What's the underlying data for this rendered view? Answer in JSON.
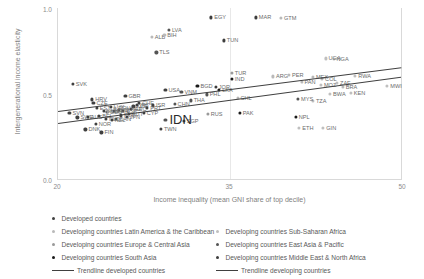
{
  "chart_data": {
    "type": "scatter",
    "title": "",
    "xlabel": "Income inequality (mean GNI share of top decile)",
    "ylabel": "Intergenerational income elasticity",
    "xlim": [
      20,
      50
    ],
    "ylim": [
      0.0,
      1.0
    ],
    "xticks": [
      "20",
      "35",
      "50"
    ],
    "yticks": [
      "1.0",
      "0.5",
      "0.0"
    ],
    "grid": "vertical-only",
    "legend_position": "bottom",
    "series": [
      {
        "name": "Developed countries",
        "color": "#404040",
        "points": [
          {
            "label": "SVK",
            "x": 21.3,
            "y": 0.555
          },
          {
            "label": "HRV",
            "x": 23.0,
            "y": 0.465
          },
          {
            "label": "CZE",
            "x": 23.1,
            "y": 0.445
          },
          {
            "label": "GBR",
            "x": 25.9,
            "y": 0.485
          },
          {
            "label": "USA",
            "x": 29.4,
            "y": 0.52
          },
          {
            "label": "LUX",
            "x": 24.6,
            "y": 0.42
          },
          {
            "label": "KOR",
            "x": 26.6,
            "y": 0.425
          },
          {
            "label": "SVN",
            "x": 21.0,
            "y": 0.385
          },
          {
            "label": "SWE",
            "x": 21.7,
            "y": 0.36
          },
          {
            "label": "AUS",
            "x": 22.6,
            "y": 0.362
          },
          {
            "label": "NLD",
            "x": 24.2,
            "y": 0.352
          },
          {
            "label": "NOR",
            "x": 23.3,
            "y": 0.32
          },
          {
            "label": "DNK",
            "x": 22.4,
            "y": 0.29
          },
          {
            "label": "FIN",
            "x": 23.8,
            "y": 0.272
          },
          {
            "label": "TWN",
            "x": 29.0,
            "y": 0.295
          },
          {
            "label": "CYP",
            "x": 27.5,
            "y": 0.385
          },
          {
            "label": "SGP",
            "x": 31.0,
            "y": 0.34
          },
          {
            "label": "ITA",
            "x": 25.3,
            "y": 0.405
          },
          {
            "label": "ESP",
            "x": 25.7,
            "y": 0.4
          },
          {
            "label": "FRA",
            "x": 24.9,
            "y": 0.397
          },
          {
            "label": "DEU",
            "x": 24.3,
            "y": 0.392
          },
          {
            "label": "BEL",
            "x": 23.6,
            "y": 0.368
          },
          {
            "label": "AUT",
            "x": 26.2,
            "y": 0.38
          },
          {
            "label": "CHE",
            "x": 27.1,
            "y": 0.445
          },
          {
            "label": "IRL",
            "x": 26.9,
            "y": 0.435
          },
          {
            "label": "ISR",
            "x": 28.3,
            "y": 0.43
          },
          {
            "label": "JPN",
            "x": 26.0,
            "y": 0.362
          },
          {
            "label": "CAN",
            "x": 25.1,
            "y": 0.352
          },
          {
            "label": "NZL",
            "x": 24.7,
            "y": 0.345
          },
          {
            "label": "POL",
            "x": 25.5,
            "y": 0.372
          },
          {
            "label": "PRT",
            "x": 27.8,
            "y": 0.418
          },
          {
            "label": "GRC",
            "x": 26.4,
            "y": 0.41
          },
          {
            "label": "HUN",
            "x": 24.0,
            "y": 0.398
          },
          {
            "label": "EST",
            "x": 23.4,
            "y": 0.415
          }
        ]
      },
      {
        "name": "Developing countries Latin America & the Caribbean",
        "color": "#b9b9b9",
        "points": [
          {
            "label": "GTM",
            "x": 39.5,
            "y": 0.94
          },
          {
            "label": "PAN",
            "x": 41.3,
            "y": 0.57
          },
          {
            "label": "CHL",
            "x": 35.7,
            "y": 0.475
          },
          {
            "label": "ALB",
            "x": 28.2,
            "y": 0.83
          },
          {
            "label": "BIH",
            "x": 29.3,
            "y": 0.845
          },
          {
            "label": "BRA",
            "x": 44.9,
            "y": 0.54
          },
          {
            "label": "ARG",
            "x": 38.8,
            "y": 0.6
          },
          {
            "label": "COL",
            "x": 43.1,
            "y": 0.585
          },
          {
            "label": "MEX",
            "x": 42.3,
            "y": 0.595
          },
          {
            "label": "PER",
            "x": 40.2,
            "y": 0.61
          }
        ]
      },
      {
        "name": "Developing countries Europe & Central Asia",
        "color": "#9a9a9a",
        "points": [
          {
            "label": "RUS",
            "x": 33.1,
            "y": 0.38
          },
          {
            "label": "TUR",
            "x": 35.2,
            "y": 0.62
          },
          {
            "label": "KAZ",
            "x": 26.1,
            "y": 0.408
          },
          {
            "label": "UKR",
            "x": 24.4,
            "y": 0.395
          },
          {
            "label": "ROU",
            "x": 25.0,
            "y": 0.418
          }
        ]
      },
      {
        "name": "Developing countries South Asia",
        "color": "#1a1a1a",
        "points": [
          {
            "label": "BGD",
            "x": 32.2,
            "y": 0.545
          },
          {
            "label": "IND",
            "x": 35.2,
            "y": 0.585
          },
          {
            "label": "PAK",
            "x": 35.9,
            "y": 0.385
          },
          {
            "label": "NPL",
            "x": 40.8,
            "y": 0.365
          },
          {
            "label": "LKA",
            "x": 34.1,
            "y": 0.52
          }
        ]
      },
      {
        "name": "Developing countries Sub-Saharan Africa",
        "color": "#bfbfbf",
        "points": [
          {
            "label": "RWA",
            "x": 46.0,
            "y": 0.605
          },
          {
            "label": "MWI",
            "x": 48.8,
            "y": 0.545
          },
          {
            "label": "MOZ",
            "x": 43.0,
            "y": 0.55
          },
          {
            "label": "BWA",
            "x": 43.8,
            "y": 0.5
          },
          {
            "label": "KEN",
            "x": 45.6,
            "y": 0.505
          },
          {
            "label": "TZA",
            "x": 42.3,
            "y": 0.455
          },
          {
            "label": "ETH",
            "x": 41.1,
            "y": 0.3
          },
          {
            "label": "GIN",
            "x": 43.2,
            "y": 0.298
          },
          {
            "label": "ZAF",
            "x": 44.4,
            "y": 0.56
          },
          {
            "label": "NGA",
            "x": 44.1,
            "y": 0.7
          },
          {
            "label": "UGA",
            "x": 43.4,
            "y": 0.705
          }
        ]
      },
      {
        "name": "Developing countries East Asia & Pacific",
        "color": "#545454",
        "points": [
          {
            "label": "TLS",
            "x": 28.6,
            "y": 0.74
          },
          {
            "label": "LVA",
            "x": 29.7,
            "y": 0.87
          },
          {
            "label": "VNM",
            "x": 30.8,
            "y": 0.51
          },
          {
            "label": "IDN",
            "x": 29.4,
            "y": 0.345,
            "big": true
          },
          {
            "label": "MYS",
            "x": 41.0,
            "y": 0.47
          },
          {
            "label": "PHL",
            "x": 33.0,
            "y": 0.495
          },
          {
            "label": "THA",
            "x": 31.6,
            "y": 0.46
          },
          {
            "label": "CHN",
            "x": 30.2,
            "y": 0.44
          }
        ]
      },
      {
        "name": "Developing countries Middle East & North Africa",
        "color": "#3d3d3d",
        "points": [
          {
            "label": "EGY",
            "x": 33.4,
            "y": 0.945
          },
          {
            "label": "MAR",
            "x": 37.3,
            "y": 0.945
          },
          {
            "label": "TUN",
            "x": 34.5,
            "y": 0.81
          },
          {
            "label": "JOR",
            "x": 33.8,
            "y": 0.54
          }
        ]
      }
    ],
    "trendlines": [
      {
        "name": "Trendline developed countries",
        "color": "#404040",
        "x1": 20.0,
        "y1": 0.33,
        "x2": 50.0,
        "y2": 0.6
      },
      {
        "name": "Trendline developing countries",
        "color": "#404040",
        "x1": 20.0,
        "y1": 0.4,
        "x2": 50.0,
        "y2": 0.655
      }
    ]
  },
  "axes": {
    "y_label": "Intergenerational income elasticity",
    "x_label": "Income inequality (mean GNI share of top decile)",
    "y_tick_top": "1.0",
    "y_tick_mid": "0.5",
    "y_tick_bottom": "0.0",
    "x_tick_left": "20",
    "x_tick_mid": "35",
    "x_tick_right": "50"
  },
  "legend": {
    "col1": [
      {
        "label": "Developed countries",
        "color": "#404040",
        "type": "dot"
      },
      {
        "label": "Developing countries Latin America & the Caribbean",
        "color": "#b9b9b9",
        "type": "dot"
      },
      {
        "label": "Developing countries Europe & Central Asia",
        "color": "#9a9a9a",
        "type": "dot"
      },
      {
        "label": "Developing countries South Asia",
        "color": "#1a1a1a",
        "type": "dot"
      },
      {
        "label": "Trendline developed countries",
        "color": "#404040",
        "type": "line"
      }
    ],
    "col2": [
      {
        "label": "Developing countries Sub-Saharan Africa",
        "color": "#bfbfbf",
        "type": "dot"
      },
      {
        "label": "Developing countries East Asia & Pacific",
        "color": "#545454",
        "type": "dot"
      },
      {
        "label": "Developing countries Middle East & North Africa",
        "color": "#3d3d3d",
        "type": "dot"
      },
      {
        "label": "Trendline developing countries",
        "color": "#404040",
        "type": "line"
      }
    ]
  }
}
